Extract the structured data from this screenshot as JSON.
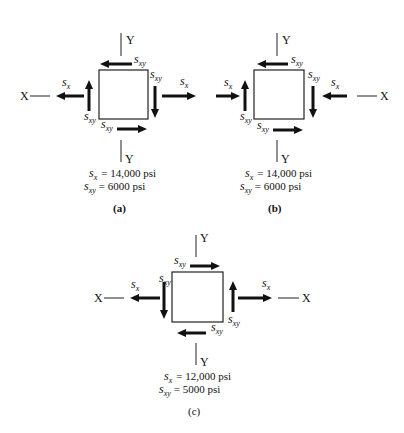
{
  "figure": {
    "panels": [
      {
        "id": "a",
        "caption": "(a)",
        "axis_x_label": "X",
        "axis_y_top_label": "Y",
        "axis_y_bottom_label": "Y",
        "stress_symbol": "s",
        "normal_sub": "x",
        "shear_sub": "xy",
        "eq1_value": "= 14,000 psi",
        "eq2_value": "= 6000 psi",
        "normal_stress": "tension",
        "shear_direction": "top-left, right-down, bottom-right, left-up"
      },
      {
        "id": "b",
        "caption": "(b)",
        "axis_x_label": "X",
        "axis_y_top_label": "Y",
        "axis_y_bottom_label": "Y",
        "stress_symbol": "s",
        "normal_sub": "x",
        "shear_sub": "xy",
        "eq1_value": "= 14,000 psi",
        "eq2_value": "= 6000 psi",
        "normal_stress": "compression",
        "shear_direction": "top-left, right-down, bottom-right, left-up"
      },
      {
        "id": "c",
        "caption": "(c)",
        "axis_x_left_label": "X",
        "axis_x_right_label": "X",
        "axis_y_top_label": "Y",
        "axis_y_bottom_label": "Y",
        "stress_symbol": "s",
        "normal_sub": "x",
        "shear_sub": "xy",
        "eq1_value": "= 12,000 psi",
        "eq2_value": "= 5000 psi",
        "normal_stress": "tension",
        "shear_direction": "top-right, right-up, bottom-left, left-down"
      }
    ]
  }
}
